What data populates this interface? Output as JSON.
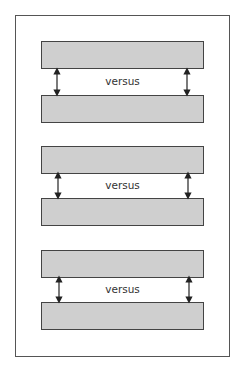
{
  "diagram": {
    "pairs": [
      {
        "label": "versus",
        "top_box_y": 41,
        "bottom_box_y": 95
      },
      {
        "label": "versus",
        "top_box_y": 146,
        "bottom_box_y": 198
      },
      {
        "label": "versus",
        "top_box_y": 250,
        "bottom_box_y": 302
      }
    ],
    "colors": {
      "box_fill": "#cfcfcf",
      "border": "#444444"
    }
  }
}
